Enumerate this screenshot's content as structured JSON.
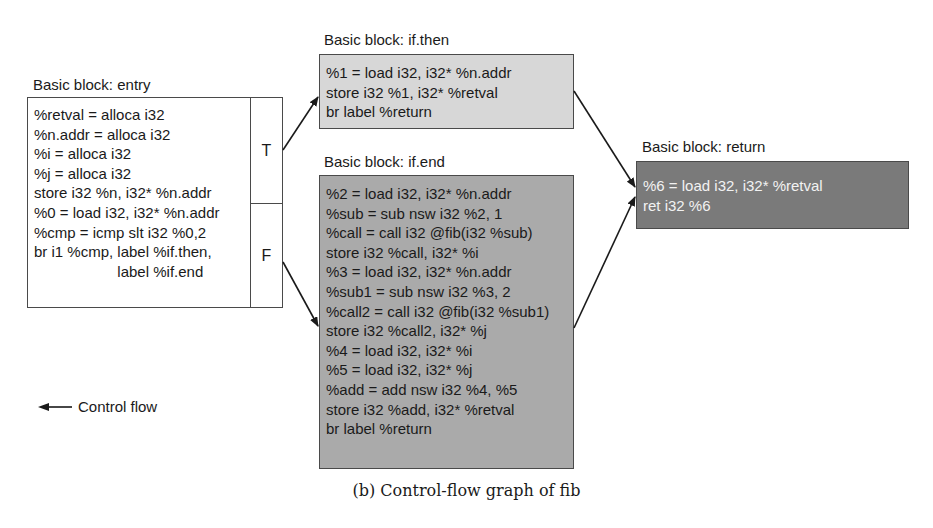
{
  "blocks": {
    "entry": {
      "title": "Basic block: entry",
      "lines": "%retval = alloca i32\n%n.addr = alloca i32\n%i = alloca i32\n%j = alloca i32\nstore i32 %n, i32* %n.addr\n%0 = load i32, i32* %n.addr\n%cmp = icmp slt i32 %0,2\nbr i1 %cmp, label %if.then,\n                    label %if.end",
      "branch_true": "T",
      "branch_false": "F",
      "fill": "#ffffff"
    },
    "if_then": {
      "title": "Basic block: if.then",
      "lines": "%1 = load i32, i32* %n.addr\nstore i32 %1, i32* %retval\nbr label %return",
      "fill": "#d7d7d7"
    },
    "if_end": {
      "title": "Basic block: if.end",
      "lines": "%2 = load i32, i32* %n.addr\n%sub = sub nsw i32 %2, 1\n%call = call i32 @fib(i32 %sub)\nstore i32 %call, i32* %i\n%3 = load i32, i32* %n.addr\n%sub1 = sub nsw i32 %3, 2\n%call2 = call i32 @fib(i32 %sub1)\nstore i32 %call2, i32* %j\n%4 = load i32, i32* %i\n%5 = load i32, i32* %j\n%add = add nsw i32 %4, %5\nstore i32 %add, i32* %retval\nbr label %return",
      "fill": "#aaaaaa"
    },
    "return": {
      "title": "Basic block: return",
      "lines": "%6 = load i32, i32* %retval\nret i32 %6",
      "fill": "#7a7a7a"
    }
  },
  "edges": [
    {
      "from": "entry.T",
      "to": "if.then"
    },
    {
      "from": "entry.F",
      "to": "if.end"
    },
    {
      "from": "if.then",
      "to": "return"
    },
    {
      "from": "if.end",
      "to": "return"
    }
  ],
  "legend": {
    "icon": "left-arrow-icon",
    "label": "Control flow"
  },
  "caption": "(b) Control-flow graph of fib"
}
